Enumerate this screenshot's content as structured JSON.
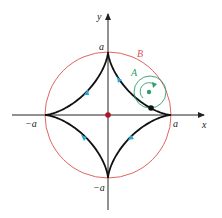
{
  "figure": {
    "labels": {
      "x_axis": "x",
      "y_axis": "y",
      "pos_a_x": "a",
      "neg_a_x": "−a",
      "pos_a_y": "a",
      "neg_a_y": "−a",
      "circle_big": "B",
      "circle_small": "A"
    },
    "colors": {
      "astroid": "#111111",
      "circle_big": "#d9534f",
      "circle_small": "#2e9e6a",
      "center_dot": "#b3122a",
      "direction_markers": "#29a8d8",
      "axes": "#222222"
    }
  }
}
